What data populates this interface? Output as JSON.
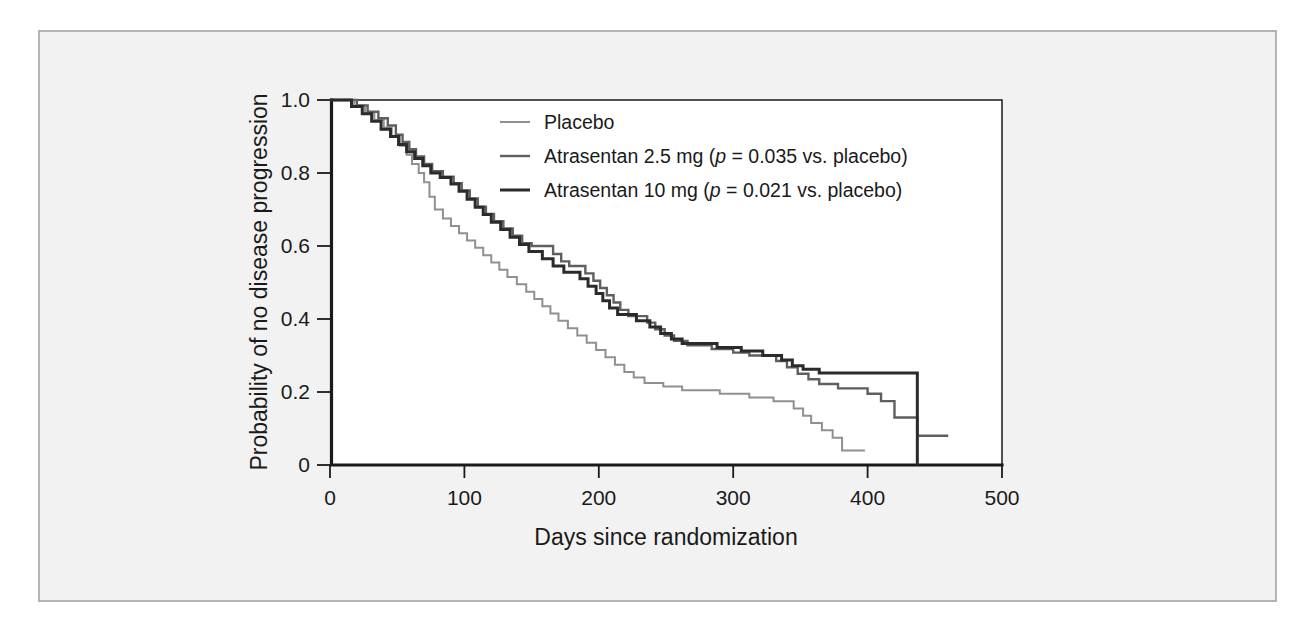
{
  "figure": {
    "background_color": "#f2f2f2",
    "border_color": "#b4b4b4",
    "plot_background": "#ffffff"
  },
  "chart_data": {
    "type": "line",
    "subtype": "kaplan-meier-step",
    "title": "",
    "xlabel": "Days since randomization",
    "ylabel": "Probability of no disease progression",
    "xlim": [
      0,
      500
    ],
    "ylim": [
      0,
      1.0
    ],
    "xticks": [
      0,
      100,
      200,
      300,
      400,
      500
    ],
    "xticklabels": [
      "0",
      "100",
      "200",
      "300",
      "400",
      "500"
    ],
    "yticks": [
      0,
      0.2,
      0.4,
      0.6,
      0.8,
      1.0
    ],
    "yticklabels": [
      "0",
      "0.2",
      "0.4",
      "0.6",
      "0.8",
      "1.0"
    ],
    "grid": false,
    "legend_position": "upper-center",
    "series": [
      {
        "name": "Placebo",
        "color": "#909090",
        "width": 2.0,
        "points": [
          [
            0,
            1.0
          ],
          [
            18,
            1.0
          ],
          [
            18,
            0.985
          ],
          [
            26,
            0.985
          ],
          [
            26,
            0.965
          ],
          [
            33,
            0.965
          ],
          [
            33,
            0.945
          ],
          [
            40,
            0.945
          ],
          [
            40,
            0.925
          ],
          [
            46,
            0.925
          ],
          [
            46,
            0.9
          ],
          [
            52,
            0.9
          ],
          [
            52,
            0.875
          ],
          [
            57,
            0.875
          ],
          [
            57,
            0.85
          ],
          [
            61,
            0.85
          ],
          [
            61,
            0.825
          ],
          [
            66,
            0.825
          ],
          [
            66,
            0.8
          ],
          [
            70,
            0.8
          ],
          [
            70,
            0.775
          ],
          [
            74,
            0.775
          ],
          [
            74,
            0.735
          ],
          [
            78,
            0.735
          ],
          [
            78,
            0.7
          ],
          [
            84,
            0.7
          ],
          [
            84,
            0.675
          ],
          [
            90,
            0.675
          ],
          [
            90,
            0.655
          ],
          [
            96,
            0.655
          ],
          [
            96,
            0.635
          ],
          [
            102,
            0.635
          ],
          [
            102,
            0.615
          ],
          [
            108,
            0.615
          ],
          [
            108,
            0.595
          ],
          [
            114,
            0.595
          ],
          [
            114,
            0.575
          ],
          [
            120,
            0.575
          ],
          [
            120,
            0.555
          ],
          [
            126,
            0.555
          ],
          [
            126,
            0.535
          ],
          [
            132,
            0.535
          ],
          [
            132,
            0.515
          ],
          [
            139,
            0.515
          ],
          [
            139,
            0.495
          ],
          [
            146,
            0.495
          ],
          [
            146,
            0.475
          ],
          [
            152,
            0.475
          ],
          [
            152,
            0.455
          ],
          [
            158,
            0.455
          ],
          [
            158,
            0.435
          ],
          [
            164,
            0.435
          ],
          [
            164,
            0.415
          ],
          [
            170,
            0.415
          ],
          [
            170,
            0.395
          ],
          [
            177,
            0.395
          ],
          [
            177,
            0.375
          ],
          [
            184,
            0.375
          ],
          [
            184,
            0.355
          ],
          [
            191,
            0.355
          ],
          [
            191,
            0.335
          ],
          [
            198,
            0.335
          ],
          [
            198,
            0.315
          ],
          [
            205,
            0.315
          ],
          [
            205,
            0.295
          ],
          [
            212,
            0.295
          ],
          [
            212,
            0.275
          ],
          [
            219,
            0.275
          ],
          [
            219,
            0.255
          ],
          [
            226,
            0.255
          ],
          [
            226,
            0.24
          ],
          [
            234,
            0.24
          ],
          [
            234,
            0.225
          ],
          [
            248,
            0.225
          ],
          [
            248,
            0.215
          ],
          [
            262,
            0.215
          ],
          [
            262,
            0.205
          ],
          [
            290,
            0.205
          ],
          [
            290,
            0.195
          ],
          [
            312,
            0.195
          ],
          [
            312,
            0.185
          ],
          [
            330,
            0.185
          ],
          [
            330,
            0.175
          ],
          [
            345,
            0.175
          ],
          [
            345,
            0.155
          ],
          [
            352,
            0.155
          ],
          [
            352,
            0.135
          ],
          [
            358,
            0.135
          ],
          [
            358,
            0.115
          ],
          [
            366,
            0.115
          ],
          [
            366,
            0.095
          ],
          [
            374,
            0.095
          ],
          [
            374,
            0.075
          ],
          [
            381,
            0.075
          ],
          [
            381,
            0.04
          ],
          [
            398,
            0.04
          ]
        ]
      },
      {
        "name": "Atrasentan 2.5 mg (p = 0.035 vs. placebo)",
        "color": "#5f5f5f",
        "width": 2.4,
        "points": [
          [
            0,
            1.0
          ],
          [
            20,
            1.0
          ],
          [
            20,
            0.985
          ],
          [
            28,
            0.985
          ],
          [
            28,
            0.968
          ],
          [
            36,
            0.968
          ],
          [
            36,
            0.95
          ],
          [
            43,
            0.95
          ],
          [
            43,
            0.93
          ],
          [
            49,
            0.93
          ],
          [
            49,
            0.905
          ],
          [
            54,
            0.905
          ],
          [
            54,
            0.885
          ],
          [
            59,
            0.885
          ],
          [
            59,
            0.865
          ],
          [
            64,
            0.865
          ],
          [
            64,
            0.845
          ],
          [
            70,
            0.845
          ],
          [
            70,
            0.825
          ],
          [
            76,
            0.825
          ],
          [
            76,
            0.805
          ],
          [
            84,
            0.805
          ],
          [
            84,
            0.79
          ],
          [
            92,
            0.79
          ],
          [
            92,
            0.772
          ],
          [
            98,
            0.772
          ],
          [
            98,
            0.752
          ],
          [
            104,
            0.752
          ],
          [
            104,
            0.73
          ],
          [
            110,
            0.73
          ],
          [
            110,
            0.708
          ],
          [
            116,
            0.708
          ],
          [
            116,
            0.688
          ],
          [
            122,
            0.688
          ],
          [
            122,
            0.668
          ],
          [
            129,
            0.668
          ],
          [
            129,
            0.648
          ],
          [
            136,
            0.648
          ],
          [
            136,
            0.628
          ],
          [
            143,
            0.628
          ],
          [
            143,
            0.608
          ],
          [
            150,
            0.608
          ],
          [
            150,
            0.6
          ],
          [
            166,
            0.6
          ],
          [
            166,
            0.578
          ],
          [
            172,
            0.578
          ],
          [
            172,
            0.558
          ],
          [
            178,
            0.558
          ],
          [
            178,
            0.545
          ],
          [
            190,
            0.545
          ],
          [
            190,
            0.525
          ],
          [
            196,
            0.525
          ],
          [
            196,
            0.505
          ],
          [
            201,
            0.505
          ],
          [
            201,
            0.485
          ],
          [
            206,
            0.485
          ],
          [
            206,
            0.465
          ],
          [
            211,
            0.465
          ],
          [
            211,
            0.445
          ],
          [
            216,
            0.445
          ],
          [
            216,
            0.425
          ],
          [
            222,
            0.425
          ],
          [
            222,
            0.408
          ],
          [
            236,
            0.408
          ],
          [
            236,
            0.39
          ],
          [
            242,
            0.39
          ],
          [
            242,
            0.372
          ],
          [
            249,
            0.372
          ],
          [
            249,
            0.355
          ],
          [
            256,
            0.355
          ],
          [
            256,
            0.34
          ],
          [
            266,
            0.34
          ],
          [
            266,
            0.328
          ],
          [
            284,
            0.328
          ],
          [
            284,
            0.318
          ],
          [
            300,
            0.318
          ],
          [
            300,
            0.308
          ],
          [
            312,
            0.308
          ],
          [
            312,
            0.3
          ],
          [
            332,
            0.3
          ],
          [
            332,
            0.285
          ],
          [
            340,
            0.285
          ],
          [
            340,
            0.268
          ],
          [
            348,
            0.268
          ],
          [
            348,
            0.25
          ],
          [
            356,
            0.25
          ],
          [
            356,
            0.235
          ],
          [
            364,
            0.235
          ],
          [
            364,
            0.222
          ],
          [
            378,
            0.222
          ],
          [
            378,
            0.21
          ],
          [
            400,
            0.21
          ],
          [
            400,
            0.195
          ],
          [
            410,
            0.195
          ],
          [
            410,
            0.175
          ],
          [
            420,
            0.175
          ],
          [
            420,
            0.13
          ],
          [
            437,
            0.13
          ],
          [
            437,
            0.08
          ],
          [
            460,
            0.08
          ]
        ]
      },
      {
        "name": "Atrasentan 10 mg (p = 0.021 vs. placebo)",
        "color": "#2b2b2b",
        "width": 3.0,
        "points": [
          [
            0,
            1.0
          ],
          [
            16,
            1.0
          ],
          [
            16,
            0.982
          ],
          [
            24,
            0.982
          ],
          [
            24,
            0.962
          ],
          [
            31,
            0.962
          ],
          [
            31,
            0.942
          ],
          [
            38,
            0.942
          ],
          [
            38,
            0.92
          ],
          [
            45,
            0.92
          ],
          [
            45,
            0.9
          ],
          [
            51,
            0.9
          ],
          [
            51,
            0.878
          ],
          [
            57,
            0.878
          ],
          [
            57,
            0.858
          ],
          [
            63,
            0.858
          ],
          [
            63,
            0.84
          ],
          [
            69,
            0.84
          ],
          [
            69,
            0.82
          ],
          [
            75,
            0.82
          ],
          [
            75,
            0.8
          ],
          [
            82,
            0.8
          ],
          [
            82,
            0.788
          ],
          [
            90,
            0.788
          ],
          [
            90,
            0.77
          ],
          [
            96,
            0.77
          ],
          [
            96,
            0.75
          ],
          [
            102,
            0.75
          ],
          [
            102,
            0.728
          ],
          [
            108,
            0.728
          ],
          [
            108,
            0.706
          ],
          [
            114,
            0.706
          ],
          [
            114,
            0.686
          ],
          [
            120,
            0.686
          ],
          [
            120,
            0.665
          ],
          [
            127,
            0.665
          ],
          [
            127,
            0.645
          ],
          [
            134,
            0.645
          ],
          [
            134,
            0.624
          ],
          [
            141,
            0.624
          ],
          [
            141,
            0.604
          ],
          [
            148,
            0.604
          ],
          [
            148,
            0.585
          ],
          [
            158,
            0.585
          ],
          [
            158,
            0.565
          ],
          [
            166,
            0.565
          ],
          [
            166,
            0.545
          ],
          [
            174,
            0.545
          ],
          [
            174,
            0.528
          ],
          [
            186,
            0.528
          ],
          [
            186,
            0.51
          ],
          [
            192,
            0.51
          ],
          [
            192,
            0.49
          ],
          [
            198,
            0.49
          ],
          [
            198,
            0.47
          ],
          [
            203,
            0.47
          ],
          [
            203,
            0.45
          ],
          [
            208,
            0.45
          ],
          [
            208,
            0.43
          ],
          [
            214,
            0.43
          ],
          [
            214,
            0.412
          ],
          [
            228,
            0.412
          ],
          [
            228,
            0.395
          ],
          [
            238,
            0.395
          ],
          [
            238,
            0.378
          ],
          [
            246,
            0.378
          ],
          [
            246,
            0.36
          ],
          [
            254,
            0.36
          ],
          [
            254,
            0.345
          ],
          [
            262,
            0.345
          ],
          [
            262,
            0.333
          ],
          [
            288,
            0.333
          ],
          [
            288,
            0.322
          ],
          [
            306,
            0.322
          ],
          [
            306,
            0.312
          ],
          [
            322,
            0.312
          ],
          [
            322,
            0.3
          ],
          [
            336,
            0.3
          ],
          [
            336,
            0.288
          ],
          [
            344,
            0.288
          ],
          [
            344,
            0.272
          ],
          [
            352,
            0.272
          ],
          [
            352,
            0.262
          ],
          [
            364,
            0.262
          ],
          [
            364,
            0.252
          ],
          [
            437,
            0.252
          ],
          [
            437,
            0.0
          ]
        ]
      }
    ],
    "legend": [
      {
        "label_prefix": "Placebo",
        "label_full": "Placebo",
        "color": "#909090",
        "has_pvalue": false,
        "drug": "Placebo",
        "pvalue": "",
        "comparator": ""
      },
      {
        "label_prefix": "Atrasentan 2.5 mg (",
        "label_full": "Atrasentan 2.5 mg (p = 0.035 vs. placebo)",
        "color": "#5f5f5f",
        "has_pvalue": true,
        "drug": "Atrasentan 2.5 mg",
        "pvalue": "0.035",
        "comparator": "vs. placebo"
      },
      {
        "label_prefix": "Atrasentan 10 mg (",
        "label_full": "Atrasentan 10 mg (p = 0.021 vs. placebo)",
        "color": "#2b2b2b",
        "has_pvalue": true,
        "drug": "Atrasentan 10 mg",
        "pvalue": "0.021",
        "comparator": "vs. placebo"
      }
    ]
  }
}
